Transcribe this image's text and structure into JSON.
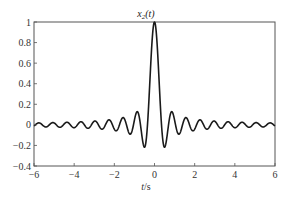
{
  "chart_data": {
    "type": "line",
    "title_main": "x",
    "title_sub": "2",
    "title_arg": "(t)",
    "xlabel": "t/s",
    "xlabel_var": "t",
    "xlabel_unit": "/s",
    "ylabel": "",
    "xlim": [
      -6,
      6
    ],
    "ylim": [
      -0.4,
      1
    ],
    "xticks": [
      -6,
      -4,
      -2,
      0,
      2,
      4,
      6
    ],
    "xtick_labels": [
      "−6",
      "−4",
      "−2",
      "0",
      "2",
      "4",
      "6"
    ],
    "yticks": [
      -0.4,
      -0.2,
      0,
      0.2,
      0.4,
      0.6,
      0.8,
      1
    ],
    "ytick_labels": [
      "−0.4",
      "−0.2",
      "0",
      "0.2",
      "0.4",
      "0.6",
      "0.8",
      "1"
    ],
    "grid": false,
    "legend": null,
    "series": [
      {
        "name": "x_2(t)",
        "description": "sinc-shaped pulse, peak 1 at t=0, first minima ≈ -0.22 near t≈±0.5, decaying oscillation with period ≈ 0.7 s",
        "x": [
          -6,
          -5.5,
          -5,
          -4.5,
          -4,
          -3.5,
          -3,
          -2.5,
          -2,
          -1.5,
          -1,
          -0.5,
          -0.35,
          0,
          0.35,
          0.5,
          1,
          1.5,
          2,
          2.5,
          3,
          3.5,
          4,
          4.5,
          5,
          5.5,
          6
        ],
        "values": [
          -0.02,
          0.02,
          -0.02,
          0.02,
          -0.02,
          0.0,
          0.04,
          -0.05,
          -0.04,
          0.06,
          0.05,
          -0.22,
          0.0,
          1.0,
          0.0,
          -0.22,
          0.05,
          0.06,
          -0.04,
          -0.05,
          0.04,
          0.0,
          -0.02,
          0.02,
          -0.02,
          0.02,
          -0.02
        ]
      }
    ],
    "line_color": "#1a1a1a"
  }
}
